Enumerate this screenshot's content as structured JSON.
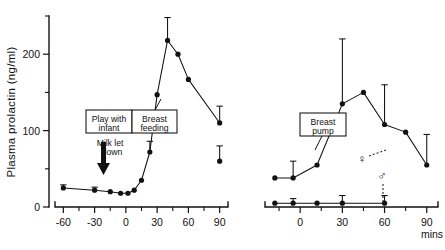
{
  "figure": {
    "y_axis_title": "Plasma prolactin (ng/ml)",
    "x_axis_unit_label": "mins"
  },
  "chart_data": {
    "type": "line",
    "title": "Plasma prolactin (ng/ml)",
    "ylabel": "Plasma prolactin (ng/ml)",
    "xlabel": "mins",
    "ylim": [
      0,
      250
    ],
    "yticks": [
      0,
      100,
      200
    ],
    "yticks_minor": [
      50,
      150,
      250
    ],
    "grid": false,
    "legend": "none",
    "panels": [
      {
        "name": "left-panel",
        "panel_id": "breast-feeding",
        "xlabel": "",
        "xlim": [
          -68,
          98
        ],
        "xticks": [
          -60,
          -30,
          0,
          30,
          60,
          90
        ],
        "xticks_minor": [
          -45,
          -15,
          15,
          45,
          75
        ],
        "annotations": [
          {
            "id": "play-with-infant",
            "text": "Play with infant",
            "x_start": -30,
            "x_end": 0
          },
          {
            "id": "breast-feeding",
            "text": "Breast feeding",
            "x_start": 0,
            "x_end": 30
          },
          {
            "id": "milk-let-down",
            "text": "Milk let down",
            "x": -18
          }
        ],
        "series": [
          {
            "name": "Breast feeding",
            "x": [
              -60,
              -30,
              -15,
              -5,
              2,
              8,
              15,
              23,
              30,
              40,
              50,
              60,
              90
            ],
            "values": [
              25,
              22,
              20,
              18,
              18,
              22,
              35,
              72,
              147,
              218,
              200,
              167,
              110
            ],
            "errors": [
              4,
              4,
              0,
              0,
              0,
              0,
              0,
              14,
              0,
              30,
              0,
              0,
              22
            ]
          }
        ],
        "extra_points": [
          {
            "x": 90,
            "y": 60,
            "error": 20
          }
        ]
      },
      {
        "name": "right-panel",
        "panel_id": "breast-pump",
        "xlabel": "mins",
        "xlim": [
          -25,
          98
        ],
        "xticks": [
          0,
          30,
          60,
          90
        ],
        "xticks_minor": [
          -15,
          15,
          45,
          75
        ],
        "annotations": [
          {
            "id": "breast-pump",
            "text": "Breast pump",
            "x_start": 0,
            "x_end": 30
          },
          {
            "id": "female-symbol",
            "text": "♀",
            "x": 62,
            "y": 72
          },
          {
            "id": "male-symbol",
            "text": "♂",
            "x": 45,
            "y": 40
          }
        ],
        "series": [
          {
            "name": "Female (breast pump)",
            "symbol": "♀",
            "x": [
              -18,
              -5,
              12,
              30,
              45,
              60,
              75,
              90
            ],
            "values": [
              38,
              38,
              55,
              135,
              150,
              108,
              98,
              55
            ],
            "errors": [
              0,
              22,
              0,
              85,
              0,
              52,
              0,
              40
            ]
          },
          {
            "name": "Male (breast pump)",
            "symbol": "♂",
            "x": [
              -18,
              -5,
              12,
              30,
              60
            ],
            "values": [
              5,
              5,
              5,
              5,
              5
            ],
            "errors": [
              0,
              6,
              0,
              10,
              10
            ]
          }
        ]
      }
    ]
  }
}
